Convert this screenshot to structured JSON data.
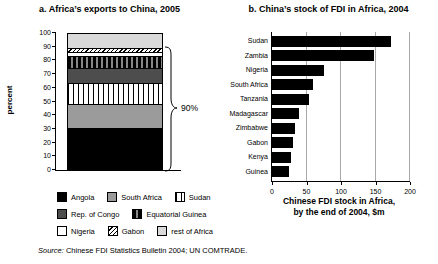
{
  "figure": {
    "source_label": "Source:",
    "source_text": " Chinese FDI Statistics Bulletin 2004; UN COMTRADE."
  },
  "chart_data": [
    {
      "type": "bar",
      "subtype": "stacked-column",
      "title": "a. Africa’s exports to China, 2005",
      "ylabel": "percent",
      "ylim": [
        0,
        100
      ],
      "yticks": [
        0,
        10,
        20,
        30,
        40,
        50,
        60,
        70,
        80,
        90,
        100
      ],
      "grid": false,
      "annotation": {
        "text": "90%",
        "span": [
          0,
          90
        ]
      },
      "series": [
        {
          "name": "Angola",
          "value": 30,
          "pattern": "solid-black"
        },
        {
          "name": "South Africa",
          "value": 18,
          "pattern": "mid-gray"
        },
        {
          "name": "Sudan",
          "value": 16,
          "pattern": "vertical-lines"
        },
        {
          "name": "Rep. of Congo",
          "value": 11,
          "pattern": "dark-gray"
        },
        {
          "name": "Equatorial Guinea",
          "value": 9,
          "pattern": "dark-vertical-stripes"
        },
        {
          "name": "Nigeria",
          "value": 3,
          "pattern": "white"
        },
        {
          "name": "Gabon",
          "value": 3,
          "pattern": "diagonal-hatch"
        },
        {
          "name": "rest of Africa",
          "value": 10,
          "pattern": "light-gray"
        }
      ],
      "legend_rows": [
        [
          0,
          1,
          2
        ],
        [
          3,
          4
        ],
        [
          5,
          6,
          7
        ]
      ],
      "legend_position": "bottom"
    },
    {
      "type": "bar",
      "subtype": "horizontal",
      "title": "b. China’s stock of FDI in Africa, 2004",
      "xlabel_line1": "Chinese FDI stock in Africa,",
      "xlabel_line2": "by the end of 2004, $m",
      "xlim": [
        0,
        200
      ],
      "xticks": [
        0,
        50,
        100,
        150,
        200
      ],
      "grid": true,
      "bar_color": "#000000",
      "categories": [
        "Sudan",
        "Zambia",
        "Nigeria",
        "South Africa",
        "Tanzania",
        "Madagascar",
        "Zimbabwe",
        "Gabon",
        "Kenya",
        "Guinea"
      ],
      "values": [
        172,
        148,
        76,
        59,
        54,
        39,
        34,
        31,
        27,
        25
      ]
    }
  ],
  "colors": {
    "bar_black": "#000000",
    "mid_gray": "#9b9b9b",
    "dark_gray": "#4d4d4d",
    "light_gray": "#d9d9d9",
    "grid_gray": "#a9a9a9",
    "background": "#ffffff"
  }
}
